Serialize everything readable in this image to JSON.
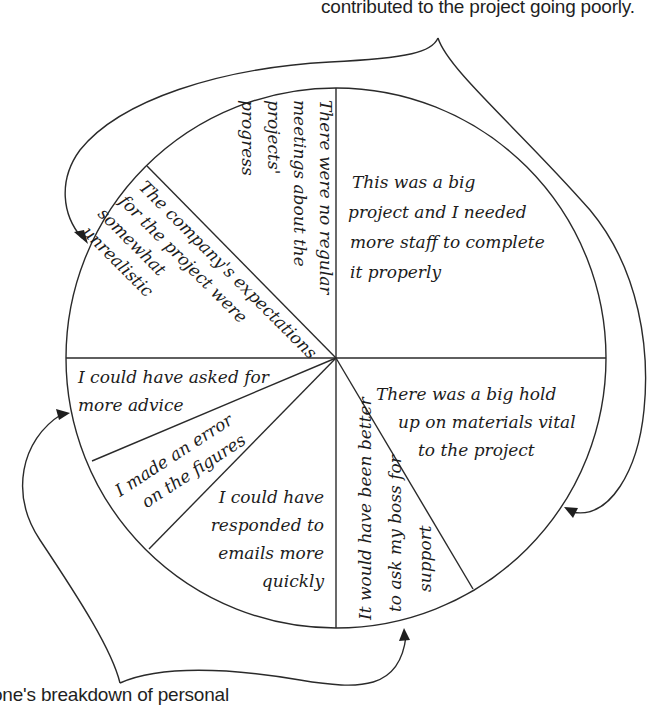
{
  "captions": {
    "top": "contributed to the project going poorly.",
    "bottom": "one's breakdown of personal"
  },
  "pie": {
    "center": [
      336,
      358
    ],
    "radius": 270,
    "slices": [
      {
        "id": "no-meetings",
        "lines": [
          "There were no regular",
          "meetings about the",
          "projects'",
          "progress"
        ]
      },
      {
        "id": "big-project-staff",
        "lines": [
          "This was a big",
          "project and I needed",
          "more staff to complete",
          "it properly"
        ]
      },
      {
        "id": "hold-up-materials",
        "lines": [
          "There was a big hold",
          "up on materials vital",
          "to the project"
        ]
      },
      {
        "id": "ask-boss-support",
        "lines": [
          "It would have been better",
          "to ask my boss for",
          "support"
        ]
      },
      {
        "id": "respond-emails",
        "lines": [
          "I could have",
          "responded to",
          "emails more",
          "quickly"
        ]
      },
      {
        "id": "error-figures",
        "lines": [
          "I made an error",
          "on the figures"
        ]
      },
      {
        "id": "more-advice",
        "lines": [
          "I could have asked for",
          "more advice"
        ]
      },
      {
        "id": "unrealistic-expectations",
        "lines": [
          "The company's expectations",
          "for the project were",
          "somewhat",
          "unrealistic"
        ]
      }
    ]
  },
  "colors": {
    "line": "#2a2a2a",
    "text": "#1c1c1c",
    "background": "#ffffff"
  }
}
